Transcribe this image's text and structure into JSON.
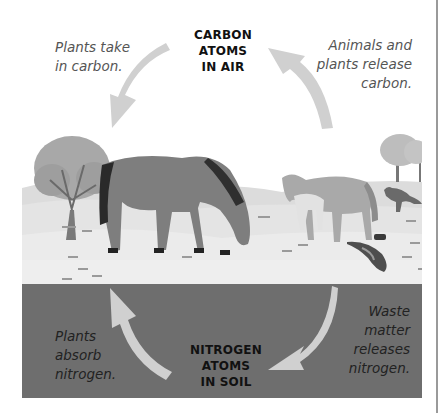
{
  "diagram": {
    "title_top": {
      "line1": "CARBON",
      "line2": "ATOMS",
      "line3": "IN AIR"
    },
    "title_bottom": {
      "line1": "NITROGEN",
      "line2": "ATOMS",
      "line3": "IN SOIL"
    },
    "captions": {
      "top_left": {
        "line1": "Plants take",
        "line2": "in carbon."
      },
      "top_right": {
        "line1": "Animals and",
        "line2": "plants release",
        "line3": "carbon."
      },
      "bottom_left": {
        "line1": "Plants",
        "line2": "absorb",
        "line3": "nitrogen."
      },
      "bottom_right": {
        "line1": "Waste",
        "line2": "matter",
        "line3": "releases",
        "line4": "nitrogen."
      }
    },
    "colors": {
      "arrow": "#d0d0d0",
      "soil": "#6e6e6e",
      "ground": "#e6e6e6",
      "sky": "#ffffff"
    },
    "scene_elements": [
      "tree-left",
      "tree-right",
      "grazing-horse",
      "standing-horse",
      "foal",
      "fox",
      "bird",
      "grass-tufts"
    ]
  }
}
